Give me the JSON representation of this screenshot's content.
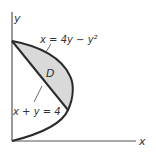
{
  "diagram": {
    "axes": {
      "x_label": "x",
      "y_label": "y"
    },
    "curves": [
      {
        "name": "parabola",
        "equation": "x = 4y − y²"
      },
      {
        "name": "line",
        "equation": "x + y = 4"
      }
    ],
    "region_label": "D",
    "colors": {
      "region_fill": "#d9d9d9",
      "curve_stroke": "#2b2b2b",
      "axis_stroke": "#555555",
      "text": "#333333"
    }
  }
}
